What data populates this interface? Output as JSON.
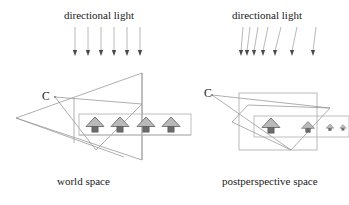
{
  "figure": {
    "width": 349,
    "height": 205,
    "background": "#ffffff",
    "line_color": "#8c8c8c",
    "light_ray_color": "#9a9a9a",
    "house_fill": "#b9b9b9",
    "house_stroke": "#6e6e6e",
    "text_color": "#1a1a1a"
  },
  "panels": {
    "left": {
      "heading": "directional light",
      "caption": "world space",
      "camera_label": "C",
      "light_rays": {
        "count": 6,
        "direction": "vertical-down",
        "x_positions": [
          75,
          88,
          101,
          114,
          127,
          140
        ],
        "y_top": 27,
        "y_bottom": 55
      },
      "houses": {
        "count": 4,
        "x_positions": [
          95,
          120,
          146,
          171
        ],
        "y": 125,
        "scale": [
          1,
          1,
          1,
          1
        ]
      },
      "ground_box": {
        "x": 79,
        "y": 114,
        "width": 112,
        "height": 21
      }
    },
    "right": {
      "heading": "directional light",
      "caption": "postperspective space",
      "camera_label": "C",
      "light_rays": {
        "count": 7,
        "direction": "slanted-converging",
        "x_top_positions": [
          243,
          250,
          258,
          268,
          281,
          297,
          316
        ],
        "x_bottom_positions": [
          241,
          247,
          254,
          263,
          275,
          292,
          313
        ],
        "y_top": 27,
        "y_bottom": 55
      },
      "houses": {
        "count": 4,
        "x_positions": [
          271,
          308,
          330,
          343
        ],
        "y": 127,
        "scale": [
          1.0,
          0.72,
          0.45,
          0.38
        ]
      },
      "view_volume_box": {
        "x": 239,
        "y": 93,
        "width": 78,
        "height": 57
      }
    }
  }
}
